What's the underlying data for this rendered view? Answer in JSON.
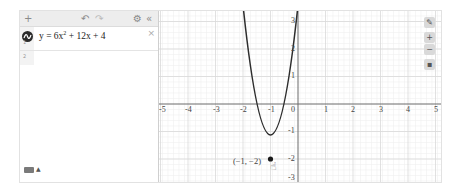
{
  "toolbar": {
    "add_icon": "+",
    "undo_icon": "↶",
    "redo_icon": "↷",
    "settings_icon": "⚙",
    "collapse_icon": "«"
  },
  "expressions": [
    {
      "index": "1",
      "latex_display": "y = 6x² + 12x + 4",
      "lhs": "y = 6x",
      "exp": "2",
      "rhs": " + 12x + 4",
      "color": "#2d2d2d",
      "delete_icon": "×"
    }
  ],
  "next_expression_index": "2",
  "keyboard": {
    "icon": "keyboard-icon",
    "arrow": "▲"
  },
  "graph": {
    "x_ticks": [
      "-5",
      "-4",
      "-3",
      "-2",
      "-1",
      "0",
      "1",
      "2",
      "3",
      "4",
      "5"
    ],
    "y_ticks_pos": [
      "3",
      "2",
      "1"
    ],
    "y_ticks_neg": [
      "-1",
      "-2",
      "-3"
    ],
    "point_label": "(−1, −2)",
    "curve_color": "#2d2d2d",
    "zoom_controls": {
      "wrench": "🔧",
      "zoom_in": "+",
      "zoom_out": "−",
      "home": "⌂"
    }
  }
}
